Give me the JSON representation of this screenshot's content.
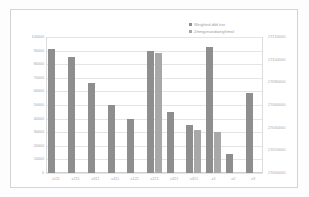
{
  "chart_data": {
    "type": "bar",
    "title": "",
    "subtitle": "",
    "xlabel": "",
    "ylabel": "",
    "grid": true,
    "legend_position": "top-right",
    "categories": [
      "x111",
      "x211",
      "x311",
      "x411",
      "x121",
      "x221",
      "x321",
      "x421",
      "z1",
      "z2",
      "z3"
    ],
    "series": [
      {
        "name": "Weighted ddd tive",
        "color": "#8e8e8e",
        "axis": "left",
        "values": [
          91000,
          85000,
          66000,
          50000,
          40000,
          90000,
          45000,
          35000,
          93000,
          14000,
          59000
        ]
      },
      {
        "name": "Zmmgznanidweightmol",
        "color": "#a8a8a8",
        "axis": "right",
        "values": [
          null,
          null,
          null,
          null,
          null,
          27106000,
          null,
          27038000,
          27036000,
          null,
          null
        ]
      }
    ],
    "left_axis": {
      "min": 0,
      "max": 100000,
      "step": 10000,
      "ticks": [
        "0",
        "10000",
        "20000",
        "30000",
        "40000",
        "50000",
        "60000",
        "70000",
        "80000",
        "90000",
        "100000"
      ]
    },
    "right_axis": {
      "min": 27000000,
      "max": 27120000,
      "step": 20000,
      "ticks": [
        "27000000",
        "27020000",
        "27040000",
        "27060000",
        "27080000",
        "27100000",
        "27120000"
      ]
    }
  },
  "legend": {
    "entries": [
      {
        "label": "Weighted ddd tive"
      },
      {
        "label": "Zmmgznanidweightmol"
      }
    ]
  }
}
